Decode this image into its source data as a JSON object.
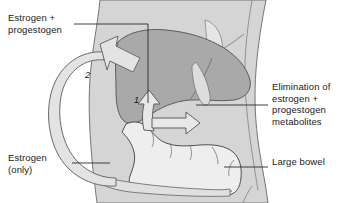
{
  "figure": {
    "type": "medical-diagram",
    "background_color": "#ffffff"
  },
  "labels": {
    "estrogen_progestogen": {
      "line1": "Estrogen +",
      "line2": "progestogen"
    },
    "estrogen_only": {
      "line1": "Estrogen",
      "line2": "(only)"
    },
    "elimination": {
      "line1": "Elimination of",
      "line2": "estrogen +",
      "line3": "progestogen",
      "line4": "metabolites"
    },
    "large_bowel": {
      "line1": "Large bowel"
    }
  },
  "arrow_numbers": {
    "one": "1",
    "two": "2"
  },
  "colors": {
    "torso_fill": "#d5d5d5",
    "torso_stroke": "#6e6e6e",
    "liver_fill": "#a9a9a9",
    "liver_stroke": "#5a5a5a",
    "bowel_fill": "#eeeeee",
    "bowel_stroke": "#555555",
    "arrow_fill": "#e3e3e3",
    "arrow_stroke": "#5f5f5f",
    "leader_line": "#2b2b2b",
    "text": "#1a1a1a"
  }
}
